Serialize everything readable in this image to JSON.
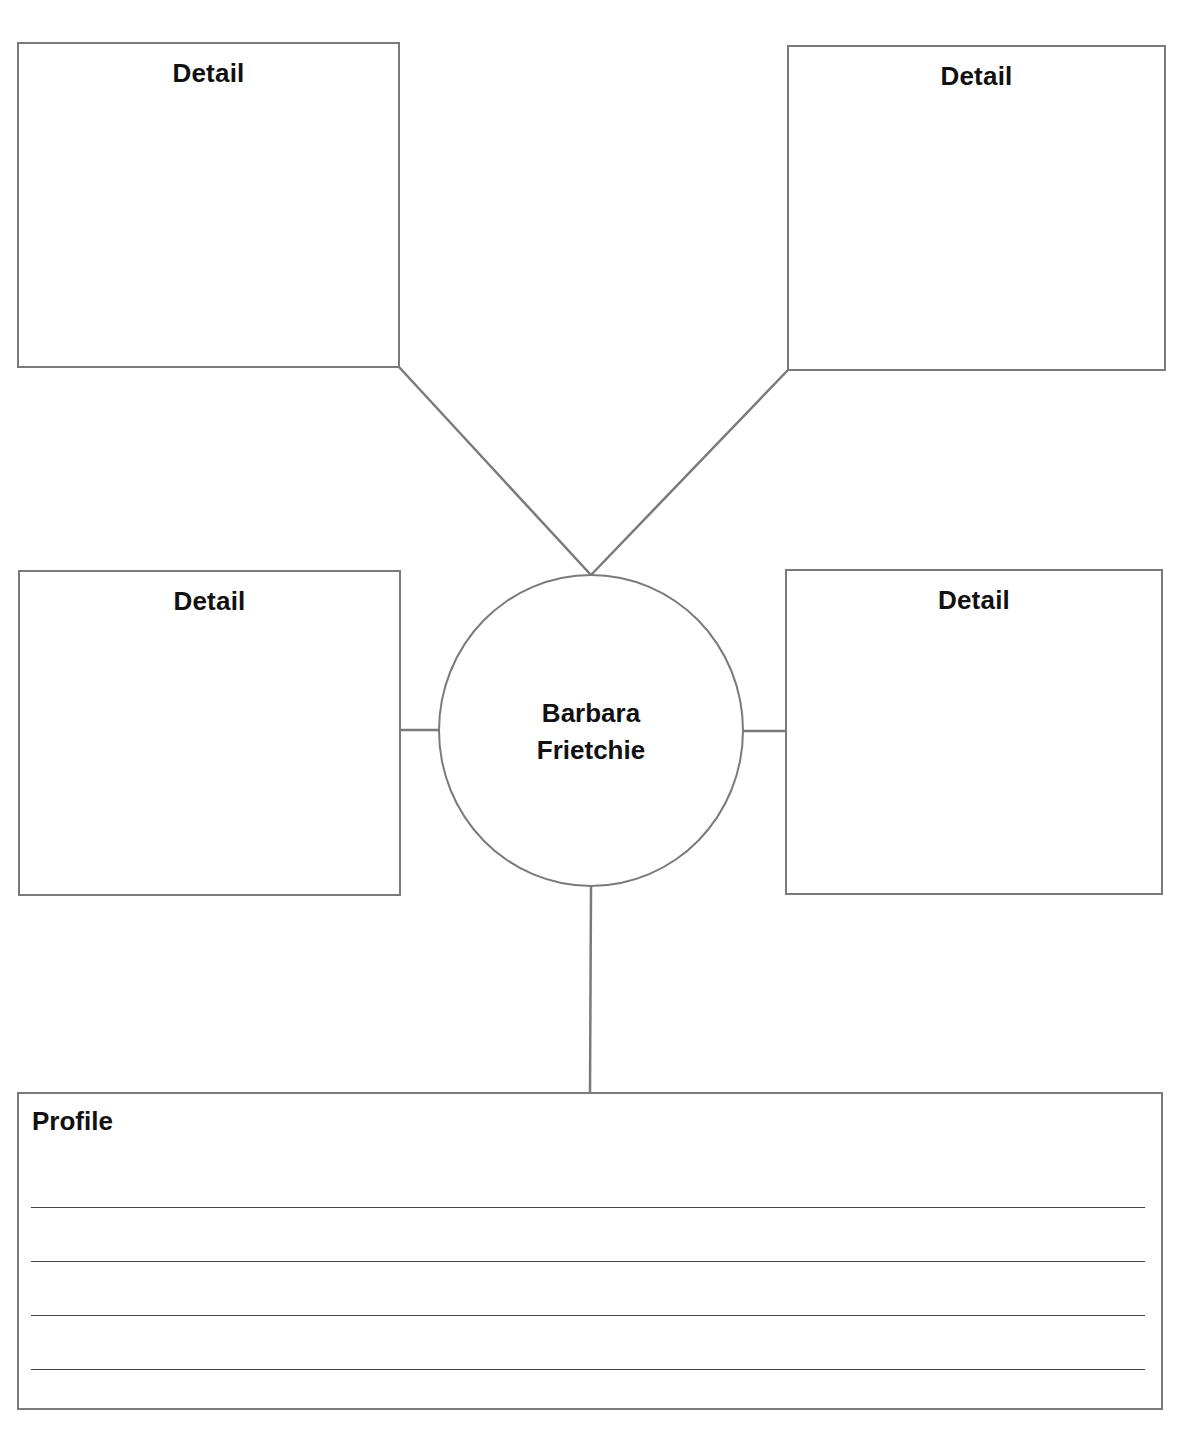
{
  "diagram": {
    "type": "web-organizer",
    "center": {
      "label_line1": "Barbara",
      "label_line2": "Frietchie"
    },
    "detail_boxes": [
      {
        "position": "top-left",
        "title": "Detail"
      },
      {
        "position": "top-right",
        "title": "Detail"
      },
      {
        "position": "middle-left",
        "title": "Detail"
      },
      {
        "position": "middle-right",
        "title": "Detail"
      }
    ],
    "profile": {
      "title": "Profile",
      "ruled_lines": 4
    },
    "colors": {
      "stroke": "#7a7a7a",
      "rule": "#444444",
      "text": "#111111",
      "background": "#ffffff"
    }
  }
}
